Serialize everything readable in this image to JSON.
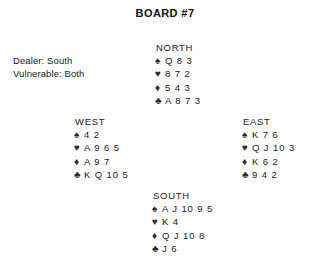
{
  "title": "BOARD #7",
  "deal_info": {
    "dealer_label": "Dealer: South",
    "vulnerable_label": "Vulnerable: Both"
  },
  "suit_symbols": {
    "spade": "♠",
    "heart": "♥",
    "diamond": "♦",
    "club": "♣"
  },
  "suit_color": "#2b2b2b",
  "text_color": "#1a1a1a",
  "background_color": "#ffffff",
  "hands": {
    "north": {
      "label": "NORTH",
      "spades": "Q 8 3",
      "hearts": "8 7 2",
      "diamonds": "5 4 3",
      "clubs": "A 8 7 3"
    },
    "west": {
      "label": "WEST",
      "spades": "4 2",
      "hearts": "A 9 6 5",
      "diamonds": "A 9 7",
      "clubs": "K Q 10 5"
    },
    "east": {
      "label": "EAST",
      "spades": "K 7 6",
      "hearts": "Q J 10 3",
      "diamonds": "K 6 2",
      "clubs": "9 4 2"
    },
    "south": {
      "label": "SOUTH",
      "spades": "A J 10 9 5",
      "hearts": "K 4",
      "diamonds": "Q J 10 8",
      "clubs": "J 6"
    }
  }
}
